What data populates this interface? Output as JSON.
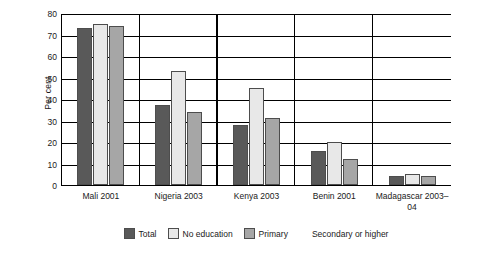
{
  "chart_data": {
    "type": "bar",
    "title": "",
    "xlabel": "",
    "ylabel": "Per cent",
    "ylim": [
      0,
      80
    ],
    "yticks": [
      0,
      10,
      20,
      30,
      40,
      50,
      60,
      70,
      80
    ],
    "grid": true,
    "legend_position": "bottom",
    "categories": [
      "Mali 2001",
      "Nigeria 2003",
      "Kenya 2003",
      "Benin 2001",
      "Madagascar 2003–04"
    ],
    "series": [
      {
        "name": "Total",
        "color": "#595959",
        "values": [
          73,
          37,
          28,
          16,
          4
        ]
      },
      {
        "name": "No education",
        "color": "#e8e8e8",
        "values": [
          75,
          53,
          45,
          20,
          5
        ]
      },
      {
        "name": "Primary",
        "color": "#a6a6a6",
        "values": [
          74,
          34,
          31,
          12,
          4
        ]
      },
      {
        "name": "Secondary or higher",
        "color": "#ffffff",
        "values": [
          null,
          null,
          null,
          null,
          null
        ]
      }
    ]
  },
  "legend": {
    "items": [
      {
        "label": "Total"
      },
      {
        "label": "No education"
      },
      {
        "label": "Primary"
      },
      {
        "label": "Secondary or higher"
      }
    ]
  }
}
